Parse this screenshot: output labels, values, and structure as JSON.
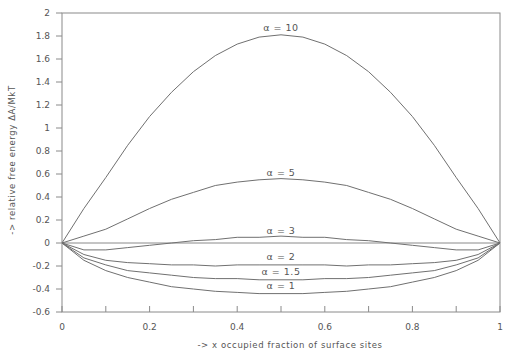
{
  "chart_data": {
    "type": "line",
    "title": "",
    "xlabel": "-> x occupied fraction of surface sites",
    "ylabel": "-> relative free energy  ΔA/MkT",
    "xlim": [
      0,
      1
    ],
    "ylim": [
      -0.6,
      2
    ],
    "grid": false,
    "x_ticks": [
      "0",
      "0.2",
      "0.4",
      "0.6",
      "0.8",
      "1"
    ],
    "y_ticks": [
      "2",
      "1.8",
      "1.6",
      "1.4",
      "1.2",
      "1",
      "0.8",
      "0.6",
      "0.4",
      "0.2",
      "0",
      "-0.2",
      "-0.4",
      "-0.6"
    ],
    "x": [
      0,
      0.05,
      0.1,
      0.15,
      0.2,
      0.25,
      0.3,
      0.35,
      0.4,
      0.45,
      0.5,
      0.55,
      0.6,
      0.65,
      0.7,
      0.75,
      0.8,
      0.85,
      0.9,
      0.95,
      1
    ],
    "series": [
      {
        "name": "α = 10",
        "values": [
          0,
          0.3,
          0.57,
          0.85,
          1.1,
          1.31,
          1.49,
          1.63,
          1.73,
          1.79,
          1.81,
          1.79,
          1.73,
          1.63,
          1.49,
          1.31,
          1.1,
          0.85,
          0.57,
          0.3,
          0
        ]
      },
      {
        "name": "α = 5",
        "values": [
          0,
          0.06,
          0.12,
          0.21,
          0.3,
          0.38,
          0.44,
          0.5,
          0.53,
          0.55,
          0.56,
          0.55,
          0.53,
          0.5,
          0.44,
          0.38,
          0.3,
          0.21,
          0.12,
          0.06,
          0
        ]
      },
      {
        "name": "α = 3",
        "values": [
          0,
          -0.06,
          -0.06,
          -0.04,
          -0.02,
          0.0,
          0.02,
          0.03,
          0.05,
          0.05,
          0.06,
          0.05,
          0.05,
          0.03,
          0.02,
          0.0,
          -0.02,
          -0.04,
          -0.06,
          -0.06,
          0
        ]
      },
      {
        "name": "α = 2",
        "values": [
          0,
          -0.1,
          -0.15,
          -0.17,
          -0.18,
          -0.19,
          -0.19,
          -0.2,
          -0.19,
          -0.19,
          -0.19,
          -0.19,
          -0.19,
          -0.2,
          -0.19,
          -0.19,
          -0.18,
          -0.17,
          -0.15,
          -0.1,
          0
        ]
      },
      {
        "name": "α = 1.5",
        "values": [
          0,
          -0.13,
          -0.19,
          -0.24,
          -0.26,
          -0.28,
          -0.3,
          -0.31,
          -0.31,
          -0.32,
          -0.32,
          -0.32,
          -0.31,
          -0.31,
          -0.3,
          -0.28,
          -0.26,
          -0.24,
          -0.19,
          -0.13,
          0
        ]
      },
      {
        "name": "α = 1",
        "values": [
          0,
          -0.15,
          -0.24,
          -0.3,
          -0.34,
          -0.38,
          -0.4,
          -0.42,
          -0.43,
          -0.44,
          -0.44,
          -0.44,
          -0.43,
          -0.42,
          -0.4,
          -0.38,
          -0.34,
          -0.3,
          -0.24,
          -0.15,
          0
        ]
      }
    ],
    "annotations": [
      {
        "text": "α = 10",
        "x": 0.5,
        "y": 1.84
      },
      {
        "text": "α = 5",
        "x": 0.5,
        "y": 0.58
      },
      {
        "text": "α = 3",
        "x": 0.5,
        "y": 0.08
      },
      {
        "text": "α = 2",
        "x": 0.5,
        "y": -0.15
      },
      {
        "text": "α = 1.5",
        "x": 0.5,
        "y": -0.28
      },
      {
        "text": "α = 1",
        "x": 0.5,
        "y": -0.4
      }
    ],
    "reference_line": {
      "y": 0,
      "style": "solid"
    }
  },
  "axes": {
    "xlabel": "-> x occupied fraction of surface sites",
    "ylabel": "-> relative free energy  ΔA/MkT"
  }
}
